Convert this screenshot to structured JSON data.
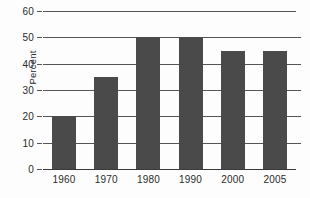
{
  "chart_data": {
    "type": "bar",
    "title": "",
    "subtitle": "",
    "xlabel": "",
    "ylabel": "Percent",
    "categories": [
      "1960",
      "1970",
      "1980",
      "1990",
      "2000",
      "2005"
    ],
    "values": [
      20,
      35,
      50,
      50,
      45,
      45
    ],
    "ylim": [
      0,
      60
    ],
    "ytick_labels": [
      "0",
      "10",
      "20",
      "30",
      "40",
      "50",
      "60"
    ],
    "ytick_values": [
      0,
      10,
      20,
      30,
      40,
      50,
      60
    ],
    "grid": true,
    "grid_orientation": "horizontal",
    "legend": false,
    "legend_position": "none",
    "annotations": [],
    "colors": {
      "bar": "#4a4a4a",
      "gridline": "#555555",
      "axis": "#3a3a3a",
      "text": "#2b2b2b",
      "background": "#fdfdfd"
    }
  }
}
